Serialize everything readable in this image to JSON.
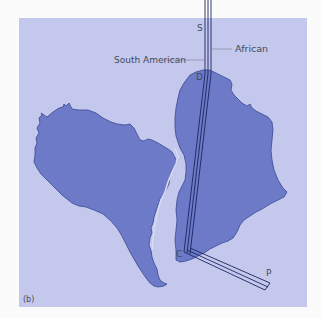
{
  "figure": {
    "panel_label": "(b)",
    "colors": {
      "page_background": "#fbfbfb",
      "ocean": "#c3c8ec",
      "continent": "#6d7ac8",
      "continent_outline": "#3a4790",
      "path_line": "#1c2560",
      "label_text": "#444a5c",
      "leader_line": "#7a80a0"
    },
    "continents": [
      {
        "name": "South America"
      },
      {
        "name": "Africa"
      }
    ],
    "points": {
      "S": "S",
      "D": "D",
      "C": "C",
      "P": "P"
    },
    "legend": {
      "south_american": "South American",
      "african": "African"
    }
  }
}
